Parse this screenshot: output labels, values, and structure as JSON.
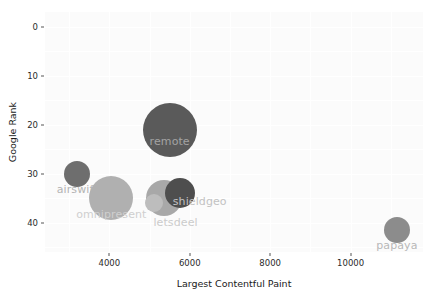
{
  "chart_data": {
    "type": "scatter",
    "title": "",
    "xlabel": "Largest Contentful Paint",
    "ylabel": "Google Rank",
    "xlim": [
      2400,
      11800
    ],
    "ylim": [
      -3,
      46
    ],
    "xticks": [
      4000,
      6000,
      8000,
      10000
    ],
    "yticks": [
      0,
      10,
      20,
      30,
      40
    ],
    "grid": true,
    "legend": "none",
    "y_axis_inverted": true,
    "points": [
      {
        "label": "airswift",
        "x": 3200,
        "y": 30,
        "size": 13,
        "color": "#6e6e6e",
        "label_color": "#b4b4b4",
        "label_dx": 0,
        "label_dy": 9
      },
      {
        "label": "omnipresent",
        "x": 4050,
        "y": 35,
        "size": 22,
        "color": "#b0b0b0",
        "label_color": "#cfcfcf",
        "label_dx": 0,
        "label_dy": 10
      },
      {
        "label": "remote",
        "x": 5500,
        "y": 21,
        "size": 27,
        "color": "#5a5a5a",
        "label_color": "#a3a3a3",
        "label_dx": 0,
        "label_dy": 5
      },
      {
        "label": "letsdeel",
        "x": 5100,
        "y": 36,
        "size": 9,
        "color": "#bdbdbd",
        "label_color": "#cbcbcb",
        "label_dx": 22,
        "label_dy": 13
      },
      {
        "label": "shieldgeo",
        "x": 5750,
        "y": 34,
        "size": 15,
        "color": "#4e4e4e",
        "label_color": "#c2c2c2",
        "label_dx": 20,
        "label_dy": 2
      },
      {
        "label": "papaya",
        "x": 11150,
        "y": 41.5,
        "size": 13,
        "color": "#8c8c8c",
        "label_color": "#b8b8b8",
        "label_dx": 0,
        "label_dy": 9
      }
    ],
    "extra_bubbles": [
      {
        "x": 5350,
        "y": 35,
        "size": 18,
        "color": "#a8a8a8"
      }
    ]
  },
  "style": {
    "plot_background": "#fbfbfb",
    "grid_color": "#ffffff",
    "tick_text_color": "#2b2b2b",
    "axis_label_color": "#1a1a1a"
  }
}
